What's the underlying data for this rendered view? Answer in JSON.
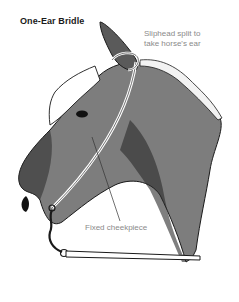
{
  "figure": {
    "title": "One-Ear Bridle",
    "annotations": [
      {
        "id": "sliphead",
        "text_line1": "Sliphead split to",
        "text_line2": "take horse's ear"
      },
      {
        "id": "cheekpiece",
        "text": "Fixed cheekpiece"
      }
    ],
    "colors": {
      "coat": "#7d7d7d",
      "coat_dark": "#2a2a2a",
      "forelock": "#ffffff",
      "label_text": "#8a8a8a",
      "title_text": "#1a1a1a"
    }
  }
}
